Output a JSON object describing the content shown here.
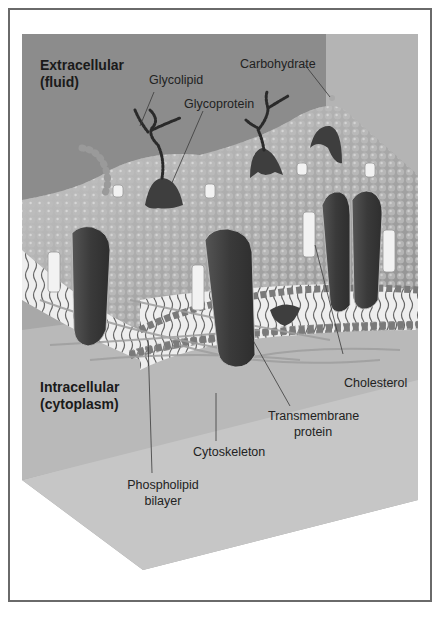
{
  "figure": {
    "regions": {
      "extracellular": {
        "line1": "Extracellular",
        "line2": "(fluid)"
      },
      "intracellular": {
        "line1": "Intracellular",
        "line2": "(cytoplasm)"
      }
    },
    "labels": {
      "glycolipid": "Glycolipid",
      "carbohydrate": "Carbohydrate",
      "glycoprotein": "Glycoprotein",
      "cholesterol": "Cholesterol",
      "transmembrane_line1": "Transmembrane",
      "transmembrane_line2": "protein",
      "cytoskeleton": "Cytoskeleton",
      "phospholipid_line1": "Phospholipid",
      "phospholipid_line2": "bilayer"
    },
    "colors": {
      "frame_border": "#6a6a6a",
      "extracellular_bg": "#8c8c8c",
      "right_panel_bg": "#b4b4b4",
      "floor_bg": "#c4c4c4",
      "protein": "#3a3a3a",
      "heads": "#7a7a7a",
      "cholesterol": "#f2f2f2"
    }
  }
}
